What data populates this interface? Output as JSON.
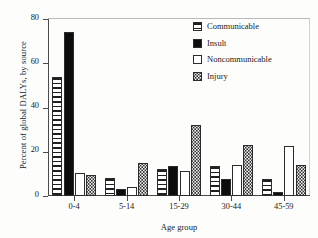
{
  "chart_data": {
    "type": "bar",
    "title": "",
    "xlabel": "Age group",
    "ylabel": "Percent of global DALYs, by source",
    "categories": [
      "0-4",
      "5-14",
      "15-29",
      "30-44",
      "45-59"
    ],
    "ylim": [
      0,
      80
    ],
    "yticks": [
      0,
      20,
      40,
      60,
      80
    ],
    "ytick_labels": [
      "0",
      "20",
      "40",
      "60",
      "80"
    ],
    "grid": false,
    "legend_position": "upper right",
    "series": [
      {
        "name": "Communicable",
        "pattern": "horizontal-stripes",
        "values": [
          54,
          8,
          12,
          13.5,
          7.5
        ]
      },
      {
        "name": "Insult",
        "pattern": "solid-black",
        "values": [
          74,
          3,
          13.5,
          7.5,
          2
        ]
      },
      {
        "name": "Noncommunicable",
        "pattern": "white-empty",
        "values": [
          10.5,
          4,
          11.5,
          14,
          22.5
        ]
      },
      {
        "name": "Injury",
        "pattern": "stippled-dots",
        "values": [
          9.5,
          15,
          32,
          23,
          14
        ]
      }
    ]
  },
  "legend": {
    "items": [
      {
        "label": "Communicable",
        "swatch": "swatch-striped-icon"
      },
      {
        "label": "Insult",
        "swatch": "swatch-solid-icon"
      },
      {
        "label": "Noncommunicable",
        "swatch": "swatch-empty-icon"
      },
      {
        "label": "Injury",
        "swatch": "swatch-dotted-icon"
      }
    ]
  },
  "colors": {
    "ink": "#1a1a1a",
    "axis": "#4a4a4a",
    "bar_outline": "#2c2c2c",
    "insult_fill": "#0d0d0d",
    "injury_fill": "#f2f2f2",
    "background": "#fdfdfc"
  }
}
